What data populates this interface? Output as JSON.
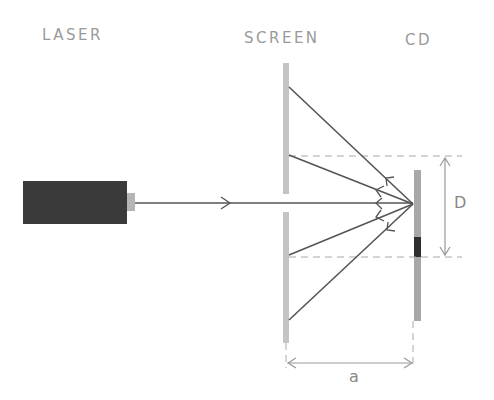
{
  "labels": {
    "laser": "LASER",
    "screen": "SCREEN",
    "cd": "CD"
  },
  "dimensions": {
    "vertical": "D",
    "horizontal": "a"
  },
  "colors": {
    "laser_body": "#3a3a3a",
    "laser_nozzle": "#b5b5b5",
    "screen": "#c4c4c4",
    "cd": "#a8a8a8",
    "cd_mark": "#2e2e2e",
    "ray": "#555555",
    "dashed": "#aaaaaa",
    "dimension_arrow": "#999999",
    "label_text": "#9a9a9a"
  }
}
